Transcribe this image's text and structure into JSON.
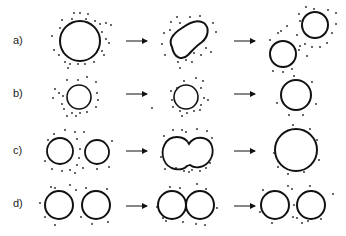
{
  "rows": [
    {
      "label": "a)",
      "y": 41
    },
    {
      "label": "b)",
      "y": 94
    },
    {
      "label": "c)",
      "y": 151
    },
    {
      "label": "d)",
      "y": 204
    }
  ],
  "colors": {
    "stroke": "#111111",
    "dot": "#222222",
    "label": "#222222"
  },
  "arrows": [
    {
      "x1": 126,
      "x2": 147,
      "y": 41
    },
    {
      "x1": 234,
      "x2": 255,
      "y": 41
    },
    {
      "x1": 126,
      "x2": 147,
      "y": 94
    },
    {
      "x1": 234,
      "x2": 255,
      "y": 94
    },
    {
      "x1": 126,
      "x2": 147,
      "y": 151
    },
    {
      "x1": 234,
      "x2": 255,
      "y": 151
    },
    {
      "x1": 126,
      "x2": 147,
      "y": 206
    },
    {
      "x1": 234,
      "x2": 255,
      "y": 206
    }
  ]
}
